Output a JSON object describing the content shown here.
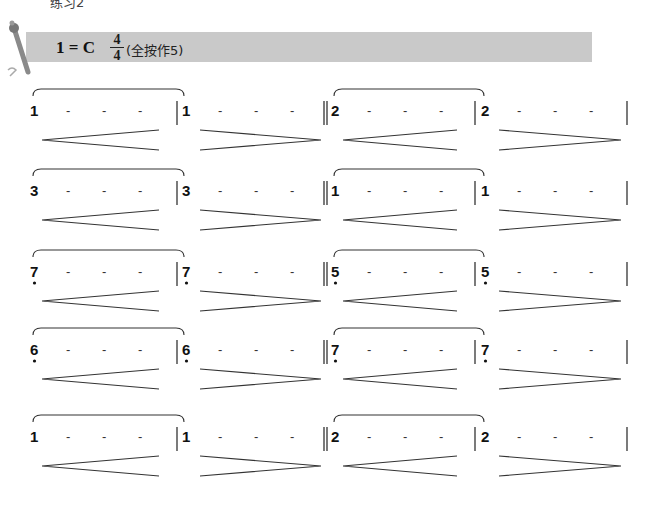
{
  "header": {
    "top_partial_text": "练习2",
    "key_signature": "1 = C",
    "time_signature": {
      "numerator": "4",
      "denominator": "4"
    },
    "fingering_note": "(全按作5)",
    "bar_color": "#c9c9c9"
  },
  "rows": [
    {
      "left_measure": {
        "note": "1",
        "dot_below": false,
        "dashes": [
          "-",
          "-",
          "-"
        ]
      },
      "left_measure_2": {
        "note": "1",
        "dot_below": false,
        "dashes": [
          "-",
          "-",
          "-"
        ]
      },
      "right_measure": {
        "note": "2",
        "dot_below": false,
        "dashes": [
          "-",
          "-",
          "-"
        ]
      },
      "right_measure_2": {
        "note": "2",
        "dot_below": false,
        "dashes": [
          "-",
          "-",
          "-"
        ]
      },
      "dynamics": [
        "crescendo",
        "decrescendo",
        "crescendo",
        "decrescendo"
      ]
    },
    {
      "left_measure": {
        "note": "3",
        "dot_below": false,
        "dashes": [
          "-",
          "-",
          "-"
        ]
      },
      "left_measure_2": {
        "note": "3",
        "dot_below": false,
        "dashes": [
          "-",
          "-",
          "-"
        ]
      },
      "right_measure": {
        "note": "1",
        "dot_below": false,
        "dashes": [
          "-",
          "-",
          "-"
        ]
      },
      "right_measure_2": {
        "note": "1",
        "dot_below": false,
        "dashes": [
          "-",
          "-",
          "-"
        ]
      },
      "dynamics": [
        "crescendo",
        "decrescendo",
        "crescendo",
        "decrescendo"
      ]
    },
    {
      "left_measure": {
        "note": "7",
        "dot_below": true,
        "dashes": [
          "-",
          "-",
          "-"
        ]
      },
      "left_measure_2": {
        "note": "7",
        "dot_below": true,
        "dashes": [
          "-",
          "-",
          "-"
        ]
      },
      "right_measure": {
        "note": "5",
        "dot_below": true,
        "dashes": [
          "-",
          "-",
          "-"
        ]
      },
      "right_measure_2": {
        "note": "5",
        "dot_below": true,
        "dashes": [
          "-",
          "-",
          "-"
        ]
      },
      "dynamics": [
        "crescendo",
        "decrescendo",
        "crescendo",
        "decrescendo"
      ]
    },
    {
      "left_measure": {
        "note": "6",
        "dot_below": true,
        "dashes": [
          "-",
          "-",
          "-"
        ]
      },
      "left_measure_2": {
        "note": "6",
        "dot_below": true,
        "dashes": [
          "-",
          "-",
          "-"
        ]
      },
      "right_measure": {
        "note": "7",
        "dot_below": true,
        "dashes": [
          "-",
          "-",
          "-"
        ]
      },
      "right_measure_2": {
        "note": "7",
        "dot_below": true,
        "dashes": [
          "-",
          "-",
          "-"
        ]
      },
      "dynamics": [
        "crescendo",
        "decrescendo",
        "crescendo",
        "decrescendo"
      ]
    },
    {
      "left_measure": {
        "note": "1",
        "dot_below": false,
        "dashes": [
          "-",
          "-",
          "-"
        ]
      },
      "left_measure_2": {
        "note": "1",
        "dot_below": false,
        "dashes": [
          "-",
          "-",
          "-"
        ]
      },
      "right_measure": {
        "note": "2",
        "dot_below": false,
        "dashes": [
          "-",
          "-",
          "-"
        ]
      },
      "right_measure_2": {
        "note": "2",
        "dot_below": false,
        "dashes": [
          "-",
          "-",
          "-"
        ]
      },
      "dynamics": [
        "crescendo",
        "decrescendo",
        "crescendo",
        "decrescendo"
      ]
    }
  ],
  "icons": {
    "decoration": "flute-pen-icon"
  }
}
